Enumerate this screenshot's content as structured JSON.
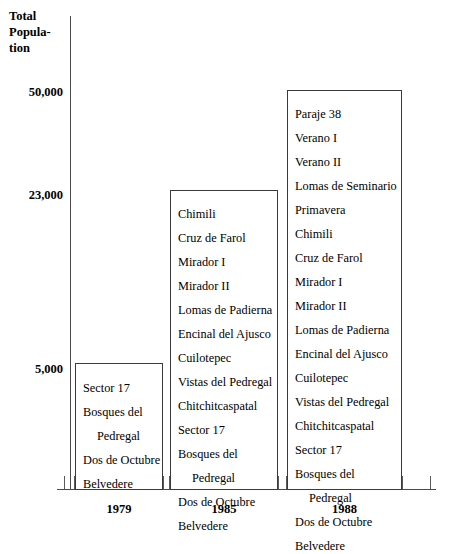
{
  "chart_data": {
    "type": "bar",
    "title": "",
    "ylabel_lines": [
      "Total",
      "Popula-",
      "tion"
    ],
    "ylabel": "Total Population",
    "xlabel": "",
    "categories": [
      "1979",
      "1985",
      "1988"
    ],
    "values": [
      5000,
      23000,
      50000
    ],
    "ytick_labels": [
      "50,000",
      "23,000",
      "5,000"
    ],
    "ytick_values": [
      50000,
      23000,
      5000
    ],
    "ylim": [
      0,
      53000
    ],
    "grid": false,
    "legend": "none",
    "bar_style": "outline",
    "annotations": "Each bar is an open rectangle listing the settlement names counted in that year's total population.",
    "series": [
      {
        "name": "1979",
        "value": 5000,
        "entries": [
          {
            "text": "Sector 17",
            "align": "left",
            "indent": false
          },
          {
            "text": "Bosques del",
            "align": "left",
            "indent": false
          },
          {
            "text": "Pedregal",
            "align": "left",
            "indent": true
          },
          {
            "text": "Dos de Octubre",
            "align": "left",
            "indent": false
          },
          {
            "text": "Belvedere",
            "align": "left",
            "indent": false
          }
        ]
      },
      {
        "name": "1985",
        "value": 23000,
        "entries": [
          {
            "text": "Chimili",
            "align": "left",
            "indent": false
          },
          {
            "text": "Cruz de Farol",
            "align": "left",
            "indent": false
          },
          {
            "text": "Mirador I",
            "align": "left",
            "indent": false
          },
          {
            "text": "Mirador II",
            "align": "left",
            "indent": false
          },
          {
            "text": "Lomas de Padierna",
            "align": "left",
            "indent": false
          },
          {
            "text": "Encinal del Ajusco",
            "align": "left",
            "indent": false
          },
          {
            "text": "Cuilotepec",
            "align": "left",
            "indent": false
          },
          {
            "text": "Vistas del Pedregal",
            "align": "left",
            "indent": false
          },
          {
            "text": "Chitchitcaspatal",
            "align": "left",
            "indent": false
          },
          {
            "text": "Sector 17",
            "align": "left",
            "indent": false
          },
          {
            "text": "Bosques del",
            "align": "left",
            "indent": false
          },
          {
            "text": "Pedregal",
            "align": "left",
            "indent": true
          },
          {
            "text": "Dos de Octubre",
            "align": "left",
            "indent": false
          },
          {
            "text": "Belvedere",
            "align": "left",
            "indent": false
          }
        ]
      },
      {
        "name": "1988",
        "value": 50000,
        "entries": [
          {
            "text": "Paraje 38",
            "align": "left",
            "indent": false
          },
          {
            "text": "Verano I",
            "align": "left",
            "indent": false
          },
          {
            "text": "Verano II",
            "align": "left",
            "indent": false
          },
          {
            "text": "Lomas de Seminario",
            "align": "left",
            "indent": false
          },
          {
            "text": "Primavera",
            "align": "left",
            "indent": false
          },
          {
            "text": "Chimili",
            "align": "left",
            "indent": false
          },
          {
            "text": "Cruz de Farol",
            "align": "left",
            "indent": false
          },
          {
            "text": "Mirador I",
            "align": "left",
            "indent": false
          },
          {
            "text": "Mirador II",
            "align": "left",
            "indent": false
          },
          {
            "text": "Lomas de Padierna",
            "align": "left",
            "indent": false
          },
          {
            "text": "Encinal del Ajusco",
            "align": "left",
            "indent": false
          },
          {
            "text": "Cuilotepec",
            "align": "left",
            "indent": false
          },
          {
            "text": "Vistas del Pedregal",
            "align": "left",
            "indent": false
          },
          {
            "text": "Chitchitcaspatal",
            "align": "left",
            "indent": false
          },
          {
            "text": "Sector 17",
            "align": "left",
            "indent": false
          },
          {
            "text": "Bosques del",
            "align": "left",
            "indent": false
          },
          {
            "text": "Pedregal",
            "align": "left",
            "indent": true
          },
          {
            "text": "Dos de Octubre",
            "align": "left",
            "indent": false
          },
          {
            "text": "Belvedere",
            "align": "left",
            "indent": false
          }
        ]
      }
    ]
  },
  "axis": {
    "y_title_line1": "Total",
    "y_title_line2": "Popula-",
    "y_title_line3": "tion",
    "ytick_50000": "50,000",
    "ytick_23000": "23,000",
    "ytick_5000": "5,000",
    "xlabel_1979": "1979",
    "xlabel_1985": "1985",
    "xlabel_1988": "1988"
  },
  "colors": {
    "background": "#ffffff",
    "text": "#000000",
    "axis_line": "#4b4b4b",
    "bar_outline": "#3a3a3a"
  }
}
